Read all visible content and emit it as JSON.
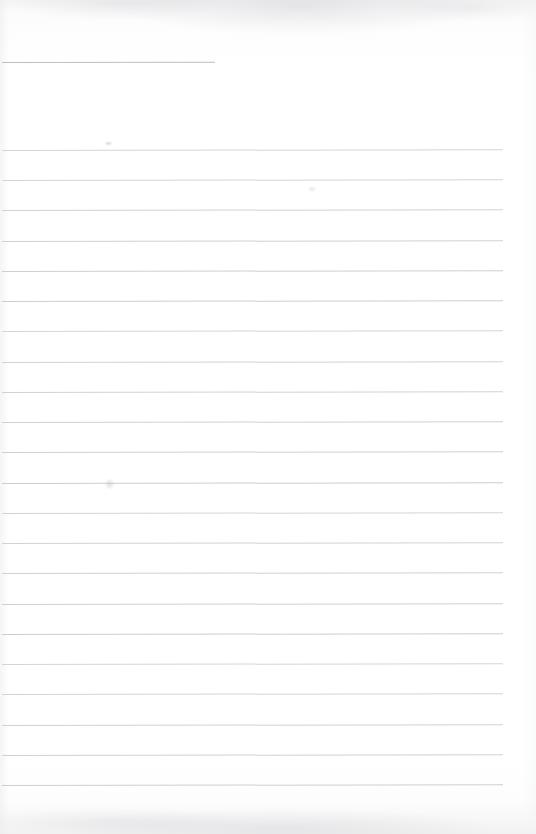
{
  "document": {
    "kind": "scanned-page",
    "title": "Blank ruled notebook page",
    "content_text": "",
    "page_width": 536,
    "page_height": 834,
    "paper_color": "#fefefe",
    "rule_color": "#c9cbcf",
    "header_rule_color": "#b9bbc0",
    "scan_shadow_color": "#f2f2f3",
    "is_blank": true,
    "written_text_present": false
  },
  "header_rule": {
    "name": "header-underline",
    "x": 2,
    "y": 62,
    "width": 213,
    "note": "short rule near top of sheet"
  },
  "ruled_lines": {
    "count": 22,
    "first_y": 150,
    "spacing": 30.2,
    "x_start": 2,
    "x_end": 503,
    "skew_degrees": -0.085,
    "y_positions": [
      150,
      180,
      210,
      241,
      271,
      301,
      331,
      362,
      392,
      422,
      452,
      483,
      513,
      543,
      573,
      604,
      634,
      664,
      694,
      725,
      755,
      785
    ]
  },
  "artifacts": {
    "top_shadow": "faint gray scan shadow along top edge",
    "bottom_shadow": "faint gray scan shadow along bottom edge",
    "left_edge_shading": "slight gray band at left margin",
    "smudges": [
      {
        "name": "smudge-upper-left",
        "x": 104,
        "y": 141
      },
      {
        "name": "smudge-mid-left",
        "x": 104,
        "y": 478
      },
      {
        "name": "smudge-upper-center",
        "x": 307,
        "y": 186
      }
    ]
  }
}
